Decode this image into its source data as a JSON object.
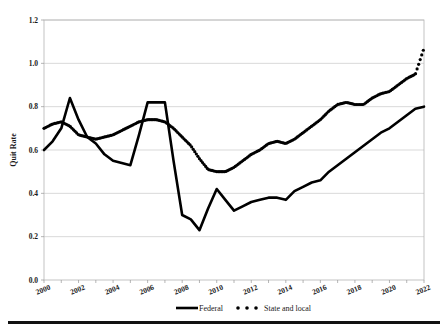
{
  "chart_data": {
    "type": "line",
    "title": "",
    "subtitle": "",
    "xlabel": "",
    "ylabel": "Quit Rate",
    "xlim": [
      2000,
      2022
    ],
    "ylim": [
      0.0,
      1.2
    ],
    "grid": true,
    "legend_position": "bottom",
    "y_ticks": [
      "0.0",
      "0.2",
      "0.4",
      "0.6",
      "0.8",
      "1.0",
      "1.2"
    ],
    "y_tick_values": [
      0.0,
      0.2,
      0.4,
      0.6,
      0.8,
      1.0,
      1.2
    ],
    "x_ticks": [
      "2000",
      "2002",
      "2004",
      "2006",
      "2008",
      "2010",
      "2012",
      "2014",
      "2016",
      "2018",
      "2020",
      "2022"
    ],
    "x_tick_values": [
      2000,
      2002,
      2004,
      2006,
      2008,
      2010,
      2012,
      2014,
      2016,
      2018,
      2020,
      2022
    ],
    "x": [
      2000.0,
      2000.5,
      2001.0,
      2001.5,
      2002.0,
      2002.5,
      2003.0,
      2003.5,
      2004.0,
      2004.5,
      2005.0,
      2005.5,
      2006.0,
      2006.5,
      2007.0,
      2007.5,
      2008.0,
      2008.5,
      2009.0,
      2009.5,
      2010.0,
      2010.5,
      2011.0,
      2011.5,
      2012.0,
      2012.5,
      2013.0,
      2013.5,
      2014.0,
      2014.5,
      2015.0,
      2015.5,
      2016.0,
      2016.5,
      2017.0,
      2017.5,
      2018.0,
      2018.5,
      2019.0,
      2019.5,
      2020.0,
      2020.5,
      2021.0,
      2021.5,
      2022.0
    ],
    "series": [
      {
        "name": "Federal",
        "style": "solid",
        "color": "#000000",
        "values": [
          0.6,
          0.64,
          0.7,
          0.84,
          0.74,
          0.66,
          0.63,
          0.58,
          0.55,
          0.54,
          0.53,
          0.67,
          0.82,
          0.82,
          0.82,
          0.55,
          0.3,
          0.28,
          0.23,
          0.33,
          0.42,
          0.37,
          0.32,
          0.34,
          0.36,
          0.37,
          0.38,
          0.38,
          0.37,
          0.41,
          0.43,
          0.45,
          0.46,
          0.5,
          0.53,
          0.56,
          0.59,
          0.62,
          0.65,
          0.68,
          0.7,
          0.73,
          0.76,
          0.79,
          0.8
        ]
      },
      {
        "name": "State and local",
        "style": "dotted",
        "color": "#000000",
        "values": [
          0.7,
          0.72,
          0.73,
          0.71,
          0.67,
          0.66,
          0.65,
          0.66,
          0.67,
          0.69,
          0.71,
          0.73,
          0.74,
          0.74,
          0.73,
          0.7,
          0.66,
          0.62,
          0.56,
          0.51,
          0.5,
          0.5,
          0.52,
          0.55,
          0.58,
          0.6,
          0.63,
          0.64,
          0.63,
          0.65,
          0.68,
          0.71,
          0.74,
          0.78,
          0.81,
          0.82,
          0.81,
          0.81,
          0.84,
          0.86,
          0.87,
          0.9,
          0.93,
          0.95,
          1.07
        ]
      }
    ],
    "annotations": []
  },
  "legend": {
    "items": [
      {
        "label": "Federal",
        "marker": "solid-line"
      },
      {
        "label": "State and local",
        "marker": "dotted-line"
      }
    ]
  }
}
